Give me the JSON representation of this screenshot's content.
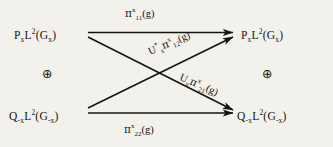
{
  "diagram": {
    "type": "commutative-diagram",
    "background_color": "#f2f1ec",
    "ink_color": "#14140f",
    "nodes": [
      {
        "id": "top-left",
        "text": "PₓL²(Gₓ)",
        "base": "P",
        "base_sub": "x",
        "space": "L",
        "space_sup": "2",
        "group": "(G",
        "group_sub": "x",
        "close": ")"
      },
      {
        "id": "top-right",
        "text": "PₓL²(Gₓ)",
        "base": "P",
        "base_sub": "x",
        "space": "L",
        "space_sup": "2",
        "group": "(G",
        "group_sub": "x",
        "close": ")"
      },
      {
        "id": "bottom-left",
        "text": "Q₋ₓL²(G₋ₓ)",
        "base": "Q",
        "base_sub": "-x",
        "space": "L",
        "space_sup": "2",
        "group": "(G",
        "group_sub": "-x",
        "close": ")"
      },
      {
        "id": "bottom-right",
        "text": "Q₋ₓL²(G₋ₓ)",
        "base": "Q",
        "base_sub": "-x",
        "space": "L",
        "space_sup": "2",
        "group": "(G",
        "group_sub": "-x",
        "close": ")"
      }
    ],
    "operators": [
      {
        "id": "oplus-left",
        "symbol": "⊕"
      },
      {
        "id": "oplus-right",
        "symbol": "⊕"
      }
    ],
    "arrows": [
      {
        "id": "top-horizontal",
        "from": "top-left",
        "to": "top-right",
        "label": {
          "prefix": "",
          "prefix_sup": "",
          "prefix_sub": "",
          "pi": "π",
          "pi_sup": "x",
          "pi_sub": "11",
          "arg": "(g)"
        }
      },
      {
        "id": "bottom-horizontal",
        "from": "bottom-left",
        "to": "bottom-right",
        "label": {
          "prefix": "",
          "prefix_sup": "",
          "prefix_sub": "",
          "pi": "π",
          "pi_sup": "x",
          "pi_sub": "22",
          "arg": "(g)"
        }
      },
      {
        "id": "diagonal-down",
        "from": "top-left",
        "to": "bottom-right",
        "label": {
          "prefix": "U",
          "prefix_sup": "*",
          "prefix_sub": "x",
          "pi": "π",
          "pi_sup": "x",
          "pi_sub": "12",
          "arg": "(g)"
        }
      },
      {
        "id": "diagonal-up",
        "from": "bottom-left",
        "to": "top-right",
        "label": {
          "prefix": "U",
          "prefix_sup": "",
          "prefix_sub": "x",
          "pi": "π",
          "pi_sup": "x",
          "pi_sub": "21",
          "arg": "(g)"
        }
      }
    ]
  }
}
